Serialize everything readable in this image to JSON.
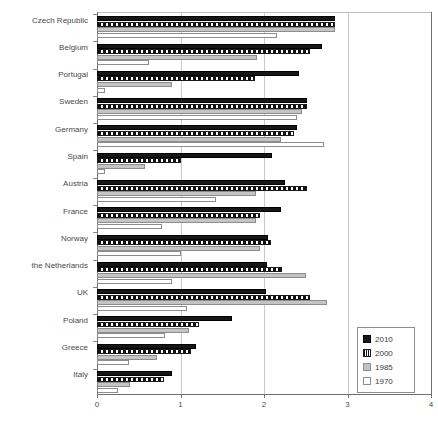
{
  "chart_data": {
    "type": "bar",
    "orientation": "horizontal",
    "title": "",
    "xlabel": "",
    "ylabel": "",
    "xlim": [
      0,
      4
    ],
    "xticks": [
      0,
      1,
      2,
      3,
      4
    ],
    "xtick_labels": [
      "0",
      "1",
      "2",
      "3",
      "4"
    ],
    "grid": true,
    "grid_axis": "x",
    "legend_position": "bottom-right",
    "categories": [
      "Czech Republic",
      "Belgium",
      "Portugal",
      "Sweden",
      "Germany",
      "Spain",
      "Austria",
      "France",
      "Norway",
      "the Netherlands",
      "UK",
      "Poland",
      "Greece",
      "Italy"
    ],
    "series": [
      {
        "name": "2010",
        "color": "#161616",
        "values": [
          2.85,
          2.7,
          2.42,
          2.52,
          2.4,
          2.1,
          2.25,
          2.2,
          2.05,
          2.03,
          2.02,
          1.62,
          1.18,
          0.9
        ]
      },
      {
        "name": "2000",
        "color": "#111111",
        "values": [
          2.85,
          2.55,
          1.89,
          2.52,
          2.36,
          1.0,
          2.52,
          1.95,
          2.08,
          2.22,
          2.55,
          1.22,
          1.12,
          0.8
        ]
      },
      {
        "name": "1985",
        "color": "#c4c4c4",
        "values": [
          2.85,
          1.92,
          0.9,
          2.45,
          2.2,
          0.57,
          1.9,
          1.9,
          1.95,
          2.5,
          2.75,
          1.1,
          0.72,
          0.4
        ]
      },
      {
        "name": "1970",
        "color": "#ffffff",
        "values": [
          2.16,
          0.62,
          0.1,
          2.4,
          2.72,
          0.1,
          1.43,
          0.78,
          1.0,
          0.9,
          1.08,
          0.82,
          0.38,
          0.25
        ]
      }
    ],
    "legend_entries": [
      {
        "label": "2010",
        "swatch": "solid-black"
      },
      {
        "label": "2000",
        "swatch": "hatched"
      },
      {
        "label": "1985",
        "swatch": "grey"
      },
      {
        "label": "1970",
        "swatch": "white"
      }
    ]
  }
}
